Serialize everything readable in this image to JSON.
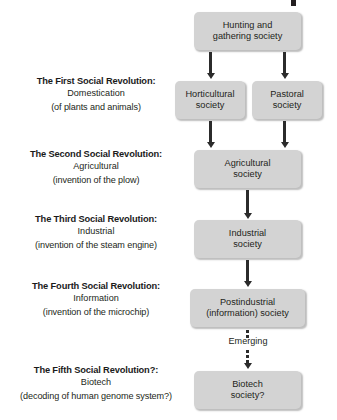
{
  "diagram": {
    "type": "flowchart",
    "title_fragment_visible": "",
    "colors": {
      "box_fill": "#d3d3d3",
      "text": "#231f20",
      "arrow": "#2b2b2b",
      "background": "#ffffff"
    },
    "revolutions": [
      {
        "title": "The First Social Revolution:",
        "subtitle": "Domestication",
        "paren": "(of plants and animals)"
      },
      {
        "title": "The Second Social Revolution:",
        "subtitle": "Agricultural",
        "paren": "(invention of the plow)"
      },
      {
        "title": "The Third Social Revolution:",
        "subtitle": "Industrial",
        "paren": "(invention of the steam engine)"
      },
      {
        "title": "The Fourth Social Revolution:",
        "subtitle": "Information",
        "paren": "(invention of the microchip)"
      },
      {
        "title": "The Fifth Social Revolution?:",
        "subtitle": "Biotech",
        "paren": "(decoding of human genome system?)"
      }
    ],
    "nodes": [
      {
        "id": "hunting",
        "line1": "Hunting and",
        "line2": "gathering society"
      },
      {
        "id": "horticultural",
        "line1": "Horticultural",
        "line2": "society"
      },
      {
        "id": "pastoral",
        "line1": "Pastoral",
        "line2": "society"
      },
      {
        "id": "agricultural",
        "line1": "Agricultural",
        "line2": "society"
      },
      {
        "id": "industrial",
        "line1": "Industrial",
        "line2": "society"
      },
      {
        "id": "postindustrial",
        "line1": "Postindustrial",
        "line2": "(information) society"
      },
      {
        "id": "biotech",
        "line1": "Biotech",
        "line2": "society?"
      }
    ],
    "edges": {
      "emerging_label": "Emerging"
    }
  }
}
